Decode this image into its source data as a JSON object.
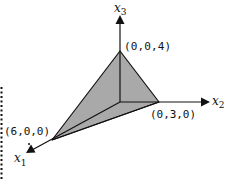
{
  "diagram": {
    "type": "3d-coordinate-plane-region",
    "axes": [
      {
        "name": "x1",
        "symbol": "x",
        "subscript": "1"
      },
      {
        "name": "x2",
        "symbol": "x",
        "subscript": "2"
      },
      {
        "name": "x3",
        "symbol": "x",
        "subscript": "3"
      }
    ],
    "vertices": [
      {
        "label": "(0,0,4)"
      },
      {
        "label": "(0,3,0)"
      },
      {
        "label": "(6,0,0)"
      }
    ],
    "colors": {
      "fill": "#a9a9a9",
      "stroke": "#111111"
    }
  }
}
